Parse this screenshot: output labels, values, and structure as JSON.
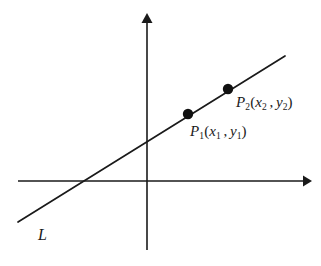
{
  "figure": {
    "name": "coordinate-plane-line-through-two-points",
    "background_color": "#ffffff",
    "stroke_color": "#1a1a1a",
    "width": 321,
    "height": 266
  },
  "axes": {
    "origin": {
      "x": 147,
      "y": 181
    },
    "x_axis": {
      "label": "",
      "start_x": 18,
      "end_x": 310,
      "y": 181,
      "arrow": "right"
    },
    "y_axis": {
      "label": "",
      "top_y": 14,
      "bottom_y": 250,
      "x": 147,
      "arrow": "up"
    }
  },
  "line": {
    "label": "L",
    "label_position": {
      "x": 38,
      "y": 227
    },
    "start": {
      "x": 18,
      "y": 222
    },
    "end": {
      "x": 285,
      "y": 56
    },
    "x_intercept": {
      "x": 88,
      "y": 181
    },
    "y_intercept": {
      "x": 147,
      "y": 145
    },
    "slope_approx": 0.61
  },
  "points": [
    {
      "id": "P1",
      "name": "point-p1",
      "center": {
        "x": 188,
        "y": 114
      },
      "radius": 5,
      "label": {
        "base": "P",
        "base_sub": "1",
        "open_paren": "(",
        "x_var": "x",
        "x_sub": "1",
        "comma": ",",
        "y_var": "y",
        "y_sub": "1",
        "close_paren": ")",
        "full_text": "P1(x1 , y1)"
      }
    },
    {
      "id": "P2",
      "name": "point-p2",
      "center": {
        "x": 228,
        "y": 89
      },
      "radius": 5,
      "label": {
        "base": "P",
        "base_sub": "2",
        "open_paren": "(",
        "x_var": "x",
        "x_sub": "2",
        "comma": ",",
        "y_var": "y",
        "y_sub": "2",
        "close_paren": ")",
        "full_text": "P2(x2 , y2)"
      }
    }
  ]
}
